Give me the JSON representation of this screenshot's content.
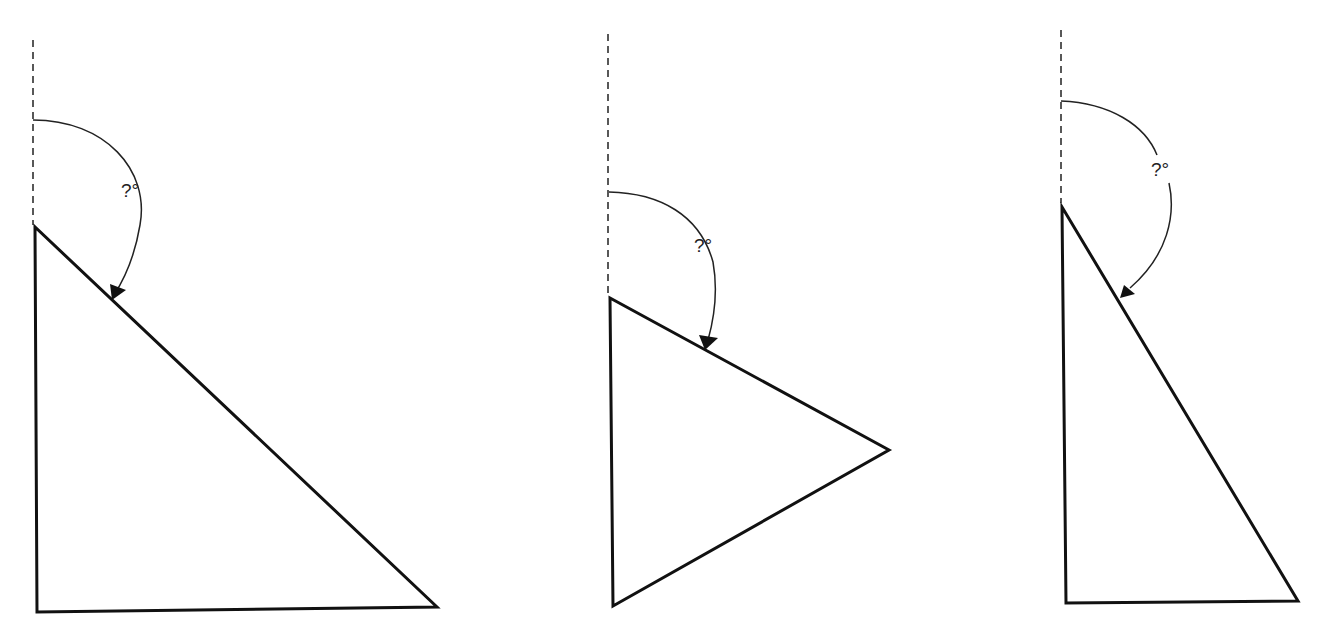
{
  "diagram": {
    "stroke_color": "#111111",
    "background": "#ffffff",
    "figures": [
      {
        "name": "triangle-1",
        "angle_label": "?°",
        "reference_line": {
          "x1": 33,
          "y1": 40,
          "x2": 33,
          "y2": 225
        },
        "vertices": [
          [
            35,
            227
          ],
          [
            37,
            612
          ],
          [
            437,
            607
          ]
        ],
        "arc_path": "M 33 120 C 105 120, 150 170, 140 225 C 135 255, 125 278, 114 295",
        "arrow": [
          [
            112,
            300
          ],
          [
            110,
            284
          ],
          [
            126,
            290
          ]
        ],
        "label_pos": [
          121,
          197
        ]
      },
      {
        "name": "triangle-2",
        "angle_label": "?°",
        "reference_line": {
          "x1": 608,
          "y1": 34,
          "x2": 608,
          "y2": 296
        },
        "vertices": [
          [
            610,
            298
          ],
          [
            613,
            606
          ],
          [
            889,
            450
          ]
        ],
        "arc_path": "M 609 192 C 660 193, 700 215, 713 262 C 718 290, 715 315, 708 340",
        "arrow": [
          [
            705,
            350
          ],
          [
            699,
            335
          ],
          [
            718,
            338
          ]
        ],
        "label_pos": [
          694,
          252
        ]
      },
      {
        "name": "triangle-3",
        "angle_label": "?°",
        "reference_line": {
          "x1": 1061,
          "y1": 30,
          "x2": 1061,
          "y2": 203
        },
        "vertices": [
          [
            1062,
            207
          ],
          [
            1066,
            603
          ],
          [
            1298,
            601
          ]
        ],
        "arc_path": "M 1061 101 C 1110 103, 1145 125, 1157 155 M 1169 183 C 1176 215, 1168 255, 1130 288",
        "arrow": [
          [
            1120,
            298
          ],
          [
            1124,
            285
          ],
          [
            1135,
            294
          ]
        ],
        "label_pos": [
          1151,
          176
        ]
      }
    ]
  }
}
